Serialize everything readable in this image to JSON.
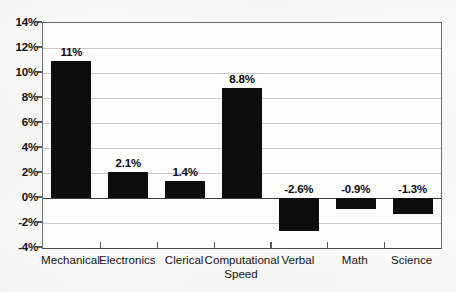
{
  "chart_data": {
    "type": "bar",
    "title": "",
    "subtitle": "",
    "xlabel": "",
    "ylabel": "",
    "categories": [
      "Mechanical",
      "Electronics",
      "Clerical",
      "Computational\nSpeed",
      "Verbal",
      "Math",
      "Science"
    ],
    "values": [
      11.0,
      2.1,
      1.4,
      8.8,
      -2.6,
      -0.9,
      -1.3
    ],
    "value_labels": [
      "11%",
      "2.1%",
      "1.4%",
      "8.8%",
      "-2.6%",
      "-0.9%",
      "-1.3%"
    ],
    "ylim": [
      -4,
      14
    ],
    "ytick_values": [
      14,
      12,
      10,
      8,
      6,
      4,
      2,
      0,
      -2,
      -4
    ],
    "ytick_labels": [
      "14%",
      "12%",
      "10%",
      "8%",
      "6%",
      "4%",
      "2%",
      "0%",
      "-2%",
      "-4%"
    ],
    "grid": true,
    "legend": null,
    "bar_color": "#0d0d0d",
    "gridline_color": "#c9c9c9",
    "axis_color": "#5a5a5a",
    "background_color": "#fdfdfc"
  }
}
